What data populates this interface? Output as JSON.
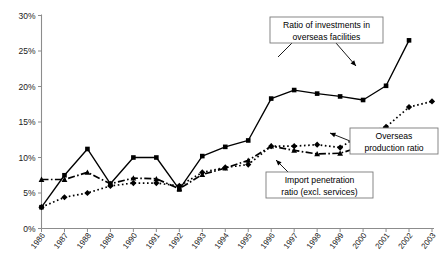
{
  "chart_data": {
    "type": "line",
    "title": "",
    "xlabel": "",
    "ylabel": "",
    "ylim": [
      0,
      30
    ],
    "ytick_labels": [
      "0%",
      "5%",
      "10%",
      "15%",
      "20%",
      "25%",
      "30%"
    ],
    "ytick_values": [
      0,
      5,
      10,
      15,
      20,
      25,
      30
    ],
    "grid": false,
    "legend_position": "annotations",
    "categories": [
      "1986",
      "1987",
      "1988",
      "1989",
      "1990",
      "1991",
      "1992",
      "1993",
      "1994",
      "1995",
      "1996",
      "1997",
      "1998",
      "1999",
      "2000",
      "2001",
      "2002",
      "2003"
    ],
    "series": [
      {
        "name": "Ratio of investments in overseas facilities",
        "marker": "square",
        "linestyle": "solid",
        "color": "#000000",
        "values": [
          3.0,
          7.5,
          11.2,
          6.3,
          10.0,
          10.0,
          5.5,
          10.2,
          11.5,
          12.4,
          18.3,
          19.5,
          19.0,
          18.6,
          18.1,
          20.1,
          26.5,
          null
        ]
      },
      {
        "name": "Overseas production ratio",
        "marker": "diamond",
        "linestyle": "dotted",
        "color": "#000000",
        "values": [
          3.0,
          4.4,
          5.0,
          6.0,
          6.4,
          6.4,
          6.0,
          7.9,
          8.6,
          9.0,
          11.6,
          11.6,
          11.8,
          11.4,
          13.4,
          14.3,
          17.1,
          17.9
        ]
      },
      {
        "name": "Import penetration ratio (excl. services)",
        "marker": "triangle",
        "linestyle": "dashdot",
        "color": "#000000",
        "values": [
          6.9,
          6.9,
          7.9,
          6.3,
          7.1,
          7.0,
          5.6,
          7.6,
          8.5,
          9.6,
          11.6,
          11.0,
          10.5,
          10.6,
          11.6,
          12.1,
          12.4,
          12.2
        ]
      }
    ],
    "annotations": [
      {
        "id": "annotation-investments",
        "lines": [
          "Ratio of investments in",
          "overseas facilities"
        ],
        "target_category": "2002"
      },
      {
        "id": "annotation-overseas-production",
        "lines": [
          "Overseas",
          "production ratio"
        ],
        "target_category": "2001"
      },
      {
        "id": "annotation-import-penetration",
        "lines": [
          "Import penetration",
          "ratio (excl. services)"
        ],
        "target_category": "2000"
      }
    ]
  }
}
